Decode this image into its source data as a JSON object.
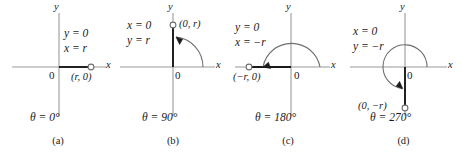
{
  "figure": {
    "type": "math-diagram",
    "colors": {
      "axis": "#9a9a9a",
      "ray": "#1a1a1a",
      "arc": "#6f6f6f",
      "text": "#1a1a1a",
      "background": "#ffffff"
    }
  },
  "panels": [
    {
      "caption": "(a)",
      "y_axis_label": "y",
      "x_axis_label": "x",
      "origin_label": "0",
      "eq1": "y = 0",
      "eq2": "x = r",
      "point_label": "(r, 0)",
      "angle_label": "θ = 0°",
      "angle_degrees": 0,
      "point": [
        1,
        0
      ],
      "has_arc": false
    },
    {
      "caption": "(b)",
      "y_axis_label": "y",
      "x_axis_label": "x",
      "origin_label": "0",
      "eq1": "x = 0",
      "eq2": "y = r",
      "point_label": "(0, r)",
      "angle_label": "θ = 90°",
      "angle_degrees": 90,
      "point": [
        0,
        1
      ],
      "has_arc": true
    },
    {
      "caption": "(c)",
      "y_axis_label": "y",
      "x_axis_label": "x",
      "origin_label": "0",
      "eq1": "y = 0",
      "eq2": "x = −r",
      "point_label": "(−r, 0)",
      "angle_label": "θ = 180°",
      "angle_degrees": 180,
      "point": [
        -1,
        0
      ],
      "has_arc": true
    },
    {
      "caption": "(d)",
      "y_axis_label": "y",
      "x_axis_label": "x",
      "origin_label": "0",
      "eq1": "x = 0",
      "eq2": "y = −r",
      "point_label": "(0, −r)",
      "angle_label": "θ = 270°",
      "angle_degrees": 270,
      "point": [
        0,
        -1
      ],
      "has_arc": true
    }
  ]
}
